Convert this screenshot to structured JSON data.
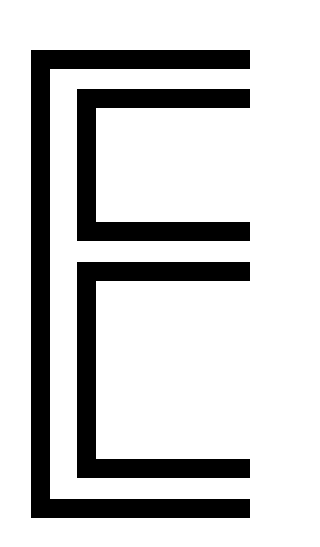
{
  "graphic": {
    "description": "Nested bracket shapes",
    "background": "#ffffff",
    "stroke_color": "#000000",
    "brackets": [
      {
        "name": "outer",
        "x": 31,
        "y": 50,
        "w": 219,
        "h": 468,
        "t": 19
      },
      {
        "name": "inner-top",
        "x": 77,
        "y": 89,
        "w": 173,
        "h": 152,
        "t": 19
      },
      {
        "name": "inner-bottom",
        "x": 77,
        "y": 262,
        "w": 173,
        "h": 216,
        "t": 19
      }
    ]
  }
}
